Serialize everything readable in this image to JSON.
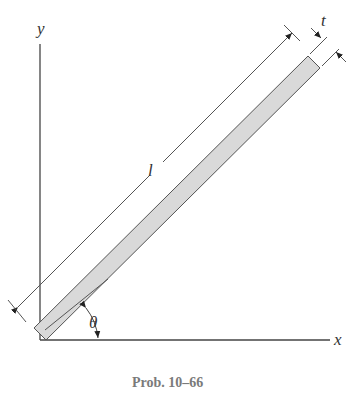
{
  "figure": {
    "caption": "Prob. 10–66",
    "axes": {
      "x_label": "x",
      "y_label": "y"
    },
    "dimensions": {
      "length_label": "l",
      "thickness_label": "t"
    },
    "angle_label": "θ",
    "colors": {
      "bar_fill": "#d9d9d9",
      "line": "#444444",
      "caption": "#7a7a7a"
    }
  }
}
